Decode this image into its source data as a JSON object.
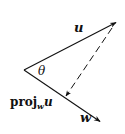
{
  "diagram": {
    "colors": {
      "stroke": "#111111",
      "background": "#ffffff"
    },
    "vertex": {
      "x": 24,
      "y": 70
    },
    "vectors": [
      {
        "name": "u",
        "label": "u",
        "from": [
          24,
          70
        ],
        "to": [
          117,
          22
        ],
        "style": "solid"
      },
      {
        "name": "w",
        "label": "w",
        "from": [
          24,
          70
        ],
        "to": [
          101,
          122
        ],
        "style": "solid"
      },
      {
        "name": "perpendicular",
        "label": "",
        "from": [
          113,
          27
        ],
        "to": [
          65,
          97
        ],
        "style": "dashed"
      }
    ],
    "labels": {
      "u": "u",
      "w": "w",
      "angle": "θ",
      "proj_main": "proj",
      "proj_sub": "w",
      "proj_arg": "u"
    }
  }
}
